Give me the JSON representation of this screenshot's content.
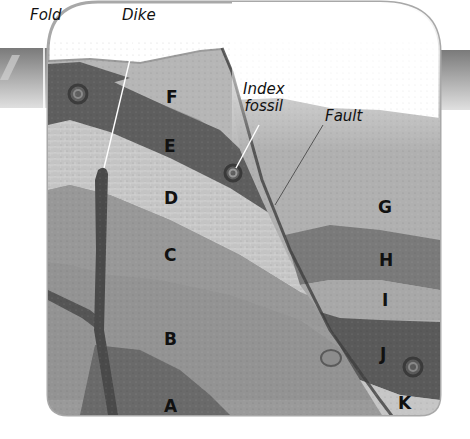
{
  "diagram": {
    "type": "geologic-cross-section",
    "callouts": [
      {
        "id": "fold",
        "label": "Fold"
      },
      {
        "id": "dike",
        "label": "Dike"
      },
      {
        "id": "index_fossil",
        "label_line1": "Index",
        "label_line2": "fossil"
      },
      {
        "id": "fault",
        "label": "Fault"
      }
    ],
    "layers": [
      {
        "id": "A",
        "label": "A"
      },
      {
        "id": "B",
        "label": "B"
      },
      {
        "id": "C",
        "label": "C"
      },
      {
        "id": "D",
        "label": "D"
      },
      {
        "id": "E",
        "label": "E"
      },
      {
        "id": "F",
        "label": "F"
      },
      {
        "id": "G",
        "label": "G"
      },
      {
        "id": "H",
        "label": "H"
      },
      {
        "id": "I",
        "label": "I"
      },
      {
        "id": "J",
        "label": "J"
      },
      {
        "id": "K",
        "label": "K"
      }
    ],
    "colors": {
      "frame": "#a8a8a8",
      "dark_layer": "#5e5e5e",
      "mid_layer": "#8a8a8a",
      "light_layer": "#b4b4b4",
      "pale_layer": "#c8c8c8",
      "dike": "#4a4a4a",
      "text": "#111111"
    }
  }
}
